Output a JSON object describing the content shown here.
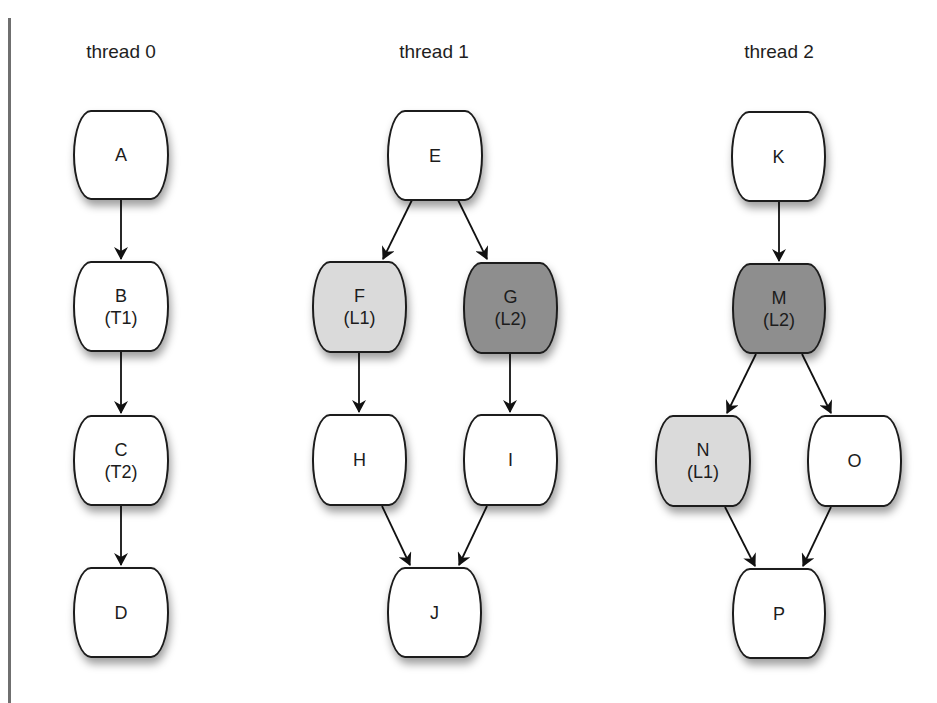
{
  "diagram": {
    "threads": [
      {
        "label": "thread 0",
        "center_x": 121
      },
      {
        "label": "thread 1",
        "center_x": 434
      },
      {
        "label": "thread 2",
        "center_x": 779
      }
    ],
    "colors": {
      "none": "#ffffff",
      "light": "#dadada",
      "dark": "#8e8e8e",
      "stroke": "#1c1c1c"
    },
    "nodes": {
      "A": {
        "label": "A",
        "sub": "",
        "thread": 0,
        "fill": "none"
      },
      "B": {
        "label": "B",
        "sub": "(T1)",
        "thread": 0,
        "fill": "none"
      },
      "C": {
        "label": "C",
        "sub": "(T2)",
        "thread": 0,
        "fill": "none"
      },
      "D": {
        "label": "D",
        "sub": "",
        "thread": 0,
        "fill": "none"
      },
      "E": {
        "label": "E",
        "sub": "",
        "thread": 1,
        "fill": "none"
      },
      "F": {
        "label": "F",
        "sub": "(L1)",
        "thread": 1,
        "fill": "light"
      },
      "G": {
        "label": "G",
        "sub": "(L2)",
        "thread": 1,
        "fill": "dark"
      },
      "H": {
        "label": "H",
        "sub": "",
        "thread": 1,
        "fill": "none"
      },
      "I": {
        "label": "I",
        "sub": "",
        "thread": 1,
        "fill": "none"
      },
      "J": {
        "label": "J",
        "sub": "",
        "thread": 1,
        "fill": "none"
      },
      "K": {
        "label": "K",
        "sub": "",
        "thread": 2,
        "fill": "none"
      },
      "M": {
        "label": "M",
        "sub": "(L2)",
        "thread": 2,
        "fill": "dark"
      },
      "N": {
        "label": "N",
        "sub": "(L1)",
        "thread": 2,
        "fill": "light"
      },
      "O": {
        "label": "O",
        "sub": "",
        "thread": 2,
        "fill": "none"
      },
      "P": {
        "label": "P",
        "sub": "",
        "thread": 2,
        "fill": "none"
      }
    },
    "edges": [
      {
        "from": "A",
        "to": "B"
      },
      {
        "from": "B",
        "to": "C"
      },
      {
        "from": "C",
        "to": "D"
      },
      {
        "from": "E",
        "to": "F"
      },
      {
        "from": "E",
        "to": "G"
      },
      {
        "from": "F",
        "to": "H"
      },
      {
        "from": "G",
        "to": "I"
      },
      {
        "from": "H",
        "to": "J"
      },
      {
        "from": "I",
        "to": "J"
      },
      {
        "from": "K",
        "to": "M"
      },
      {
        "from": "M",
        "to": "N"
      },
      {
        "from": "M",
        "to": "O"
      },
      {
        "from": "N",
        "to": "P"
      },
      {
        "from": "O",
        "to": "P"
      }
    ]
  }
}
